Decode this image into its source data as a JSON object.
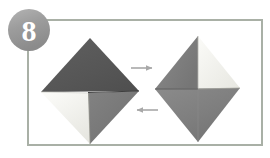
{
  "figure": {
    "kind": "origami-instruction-step",
    "step_badge": {
      "label": "8",
      "shape": "circle",
      "fill": "#9a9a9a",
      "text_color": "#ffffff",
      "center": [
        29,
        30
      ],
      "radius": 21
    },
    "frame": {
      "name": "panel-border",
      "stroke": "#a9b0a6",
      "fill": "#ffffff",
      "x": 27,
      "y": 19,
      "width": 236,
      "height": 127,
      "stroke_width": 2
    },
    "palette": {
      "paper_dark": "#5c5c5c",
      "paper_mid": "#7b7b7b",
      "paper_light": "#f2f2ee",
      "paper_shadow": "#6e6e6e",
      "fold_line": "#4a4a4a",
      "arrow": "#a8a8a8",
      "background": "#ffffff"
    },
    "shapes": [
      {
        "name": "origami-left",
        "description": "Square rotated 45 degrees; dark gray upper half, white flap lower-left, gray flap lower-right",
        "center": [
          90,
          91
        ],
        "vertices": {
          "top": [
            90,
            38
          ],
          "right": [
            139,
            91
          ],
          "bottom": [
            90,
            144
          ],
          "left": [
            41,
            92
          ]
        },
        "facets": [
          {
            "name": "facet-top-dark",
            "color": "#555555"
          },
          {
            "name": "facet-lower-left-white",
            "color": "#f2f2ee"
          },
          {
            "name": "facet-lower-right-gray",
            "color": "#787878"
          }
        ]
      },
      {
        "name": "origami-right",
        "description": "Square rotated 45 degrees; gray upper-left, white upper-right, gray lower half",
        "center": [
          198,
          89
        ],
        "vertices": {
          "top": [
            198,
            36
          ],
          "right": [
            240,
            88
          ],
          "bottom": [
            198,
            142
          ],
          "left": [
            155,
            89
          ]
        },
        "facets": [
          {
            "name": "facet-upper-left-gray",
            "color": "#818181"
          },
          {
            "name": "facet-upper-right-white",
            "color": "#f0f0ec"
          },
          {
            "name": "facet-lower-gray",
            "color": "#808080"
          }
        ]
      }
    ],
    "arrows": [
      {
        "name": "arrow-right",
        "direction": "right",
        "from": [
          131,
          68
        ],
        "to": [
          157,
          68
        ],
        "color": "#a8a8a8"
      },
      {
        "name": "arrow-left",
        "direction": "left",
        "from": [
          158,
          110
        ],
        "to": [
          131,
          110
        ],
        "color": "#a8a8a8"
      }
    ]
  }
}
